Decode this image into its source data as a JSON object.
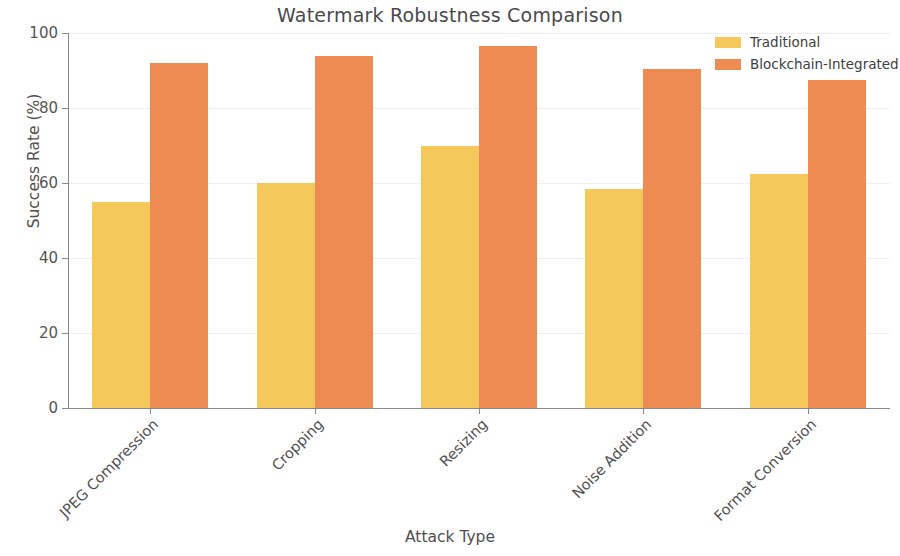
{
  "chart_data": {
    "type": "bar",
    "title": "Watermark Robustness Comparison",
    "xlabel": "Attack Type",
    "ylabel": "Success Rate (%)",
    "categories": [
      "JPEG Compression",
      "Cropping",
      "Resizing",
      "Noise Addition",
      "Format Conversion"
    ],
    "series": [
      {
        "name": "Traditional",
        "color": "#F5C85C",
        "values": [
          55,
          60,
          70,
          58.5,
          62.5
        ]
      },
      {
        "name": "Blockchain-Integrated",
        "color": "#ED8B52",
        "values": [
          92,
          94,
          96.5,
          90.5,
          87.5
        ]
      }
    ],
    "ylim": [
      0,
      100
    ],
    "yticks": [
      0,
      20,
      40,
      60,
      80,
      100
    ],
    "ytick_labels": [
      "0",
      "20",
      "40",
      "60",
      "80",
      "100"
    ],
    "grid": true,
    "grid_axis": "y",
    "legend_position": "upper right",
    "background": "#ffffff"
  }
}
